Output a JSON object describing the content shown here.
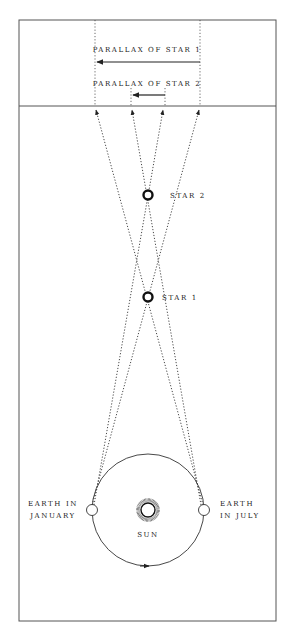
{
  "diagram": {
    "labels": {
      "parallax_star1": "PARALLAX OF STAR 1",
      "parallax_star2": "PARALLAX OF STAR 2",
      "star2": "STAR 2",
      "star1": "STAR 1",
      "earth_january_line1": "EARTH IN",
      "earth_january_line2": "JANUARY",
      "earth_july_line1": "EARTH",
      "earth_july_line2": "IN JULY",
      "sun": "SUN"
    },
    "colors": {
      "line": "#333333",
      "frame": "#555555"
    }
  }
}
